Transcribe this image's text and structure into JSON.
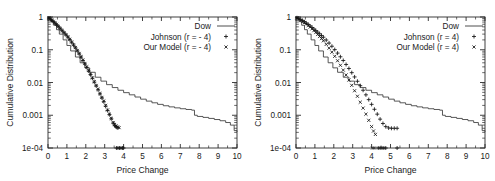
{
  "figure": {
    "panel_count": 2,
    "background": "#ffffff",
    "ink": "#1a1a1a"
  },
  "chart_data": [
    {
      "type": "line",
      "panel": "left",
      "title": "",
      "xlabel": "Price Change",
      "ylabel": "Cumulative Distribution",
      "xlim": [
        0,
        10
      ],
      "ylim": [
        0.0001,
        1
      ],
      "yscale": "log",
      "xscale": "linear",
      "grid": false,
      "xticks": [
        0,
        1,
        2,
        3,
        4,
        5,
        6,
        7,
        8,
        9,
        10
      ],
      "xticklabels": [
        "0",
        "1",
        "2",
        "3",
        "4",
        "5",
        "6",
        "7",
        "8",
        "9",
        "10"
      ],
      "yticks": [
        1,
        0.1,
        0.01,
        0.001,
        0.0001
      ],
      "yticklabels": [
        "1",
        "0.1",
        "0.01",
        "0.001",
        "1e-04"
      ],
      "legend_position": "top-right",
      "legend": [
        {
          "name": "Dow",
          "marker": "line"
        },
        {
          "name": "Johnson (r = - 4)",
          "marker": "+"
        },
        {
          "name": "Our Model (r = - 4)",
          "marker": "x"
        }
      ],
      "series": [
        {
          "name": "Dow",
          "marker": "line",
          "x": [
            0.0,
            0.08,
            0.18,
            0.3,
            0.45,
            0.6,
            0.8,
            1.0,
            1.2,
            1.45,
            1.7,
            1.95,
            2.2,
            2.5,
            2.8,
            3.1,
            3.4,
            3.7,
            4.0,
            4.3,
            4.6,
            4.9,
            5.2,
            5.5,
            5.8,
            6.1,
            6.4,
            6.7,
            7.0,
            7.3,
            7.6,
            7.75,
            7.9,
            8.2,
            8.5,
            8.8,
            9.1,
            9.4,
            9.65,
            9.85,
            10.0
          ],
          "y": [
            1.0,
            0.87,
            0.72,
            0.56,
            0.41,
            0.3,
            0.2,
            0.135,
            0.092,
            0.06,
            0.04,
            0.028,
            0.0205,
            0.0145,
            0.011,
            0.0086,
            0.007,
            0.0058,
            0.0049,
            0.0042,
            0.0036,
            0.0031,
            0.0027,
            0.0024,
            0.00215,
            0.00195,
            0.0018,
            0.00168,
            0.00158,
            0.0015,
            0.00143,
            0.001,
            0.00092,
            0.00086,
            0.0008,
            0.00074,
            0.00068,
            0.0006,
            0.0005,
            0.00034,
            0.00032
          ]
        },
        {
          "name": "Johnson (r = - 4)",
          "marker": "+",
          "x": [
            0.05,
            0.12,
            0.2,
            0.28,
            0.36,
            0.45,
            0.55,
            0.65,
            0.75,
            0.85,
            0.95,
            1.05,
            1.15,
            1.25,
            1.35,
            1.45,
            1.55,
            1.65,
            1.75,
            1.85,
            1.95,
            2.05,
            2.15,
            2.25,
            2.35,
            2.45,
            2.55,
            2.65,
            2.75,
            2.85,
            2.95,
            3.05,
            3.15,
            3.25,
            3.35,
            3.45,
            3.52,
            3.58,
            3.64,
            3.7,
            3.62,
            3.7,
            3.78,
            3.86,
            3.94,
            4.0
          ],
          "y": [
            0.93,
            0.87,
            0.8,
            0.73,
            0.66,
            0.59,
            0.51,
            0.44,
            0.38,
            0.33,
            0.285,
            0.245,
            0.205,
            0.17,
            0.14,
            0.115,
            0.093,
            0.075,
            0.06,
            0.047,
            0.037,
            0.029,
            0.0225,
            0.0175,
            0.0135,
            0.0103,
            0.0079,
            0.006,
            0.0045,
            0.0034,
            0.0026,
            0.0019,
            0.0014,
            0.00105,
            0.00078,
            0.00058,
            0.0005,
            0.00046,
            0.00043,
            0.00041,
            0.0001,
            0.0001,
            0.0001,
            0.0001,
            0.0001,
            0.0001
          ]
        },
        {
          "name": "Our Model (r = - 4)",
          "marker": "x",
          "x": [
            0.05,
            0.12,
            0.2,
            0.28,
            0.36,
            0.45,
            0.55,
            0.65,
            0.75,
            0.85,
            0.95,
            1.05,
            1.15,
            1.25,
            1.35,
            1.45,
            1.55,
            1.65,
            1.75,
            1.85,
            1.95,
            2.05,
            2.15,
            2.25,
            2.35,
            2.45,
            2.55,
            2.65,
            2.75,
            2.85,
            2.95,
            3.05,
            3.15,
            3.25,
            3.35,
            3.45,
            3.52,
            3.6,
            3.68,
            3.76
          ],
          "y": [
            0.935,
            0.875,
            0.805,
            0.735,
            0.665,
            0.595,
            0.515,
            0.445,
            0.385,
            0.335,
            0.29,
            0.248,
            0.208,
            0.172,
            0.142,
            0.117,
            0.095,
            0.077,
            0.061,
            0.048,
            0.038,
            0.03,
            0.0232,
            0.018,
            0.0139,
            0.0106,
            0.0081,
            0.0062,
            0.0046,
            0.0035,
            0.0027,
            0.002,
            0.00145,
            0.00108,
            0.0008,
            0.0006,
            0.00052,
            0.00047,
            0.00044,
            0.00042
          ]
        }
      ]
    },
    {
      "type": "line",
      "panel": "right",
      "title": "",
      "xlabel": "Price Change",
      "ylabel": "Cumulative Distribution",
      "xlim": [
        0,
        10
      ],
      "ylim": [
        0.0001,
        1
      ],
      "yscale": "log",
      "xscale": "linear",
      "grid": false,
      "xticks": [
        0,
        1,
        2,
        3,
        4,
        5,
        6,
        7,
        8,
        9,
        10
      ],
      "xticklabels": [
        "0",
        "1",
        "2",
        "3",
        "4",
        "5",
        "6",
        "7",
        "8",
        "9",
        "10"
      ],
      "yticks": [
        1,
        0.1,
        0.01,
        0.001,
        0.0001
      ],
      "yticklabels": [
        "1",
        "0.1",
        "0.01",
        "0.001",
        "1e-04"
      ],
      "legend_position": "top-right",
      "legend": [
        {
          "name": "Dow",
          "marker": "line"
        },
        {
          "name": "Johnson (r = 4)",
          "marker": "+"
        },
        {
          "name": "Our Model (r = 4)",
          "marker": "x"
        }
      ],
      "series": [
        {
          "name": "Dow",
          "marker": "line",
          "x": [
            0.0,
            0.08,
            0.18,
            0.3,
            0.45,
            0.6,
            0.8,
            1.0,
            1.2,
            1.45,
            1.7,
            1.95,
            2.2,
            2.5,
            2.8,
            3.1,
            3.4,
            3.7,
            4.0,
            4.3,
            4.6,
            4.9,
            5.2,
            5.5,
            5.8,
            6.1,
            6.4,
            6.7,
            7.0,
            7.3,
            7.6,
            7.75,
            7.9,
            8.2,
            8.5,
            8.8,
            9.1,
            9.4,
            9.65,
            9.85,
            10.0
          ],
          "y": [
            1.0,
            0.87,
            0.72,
            0.56,
            0.41,
            0.3,
            0.2,
            0.135,
            0.092,
            0.06,
            0.04,
            0.028,
            0.0205,
            0.0145,
            0.011,
            0.0086,
            0.007,
            0.0058,
            0.0049,
            0.0042,
            0.0036,
            0.0031,
            0.0027,
            0.0024,
            0.00215,
            0.00195,
            0.0018,
            0.00168,
            0.00158,
            0.0015,
            0.00143,
            0.001,
            0.00092,
            0.00086,
            0.0008,
            0.00074,
            0.00068,
            0.0006,
            0.0005,
            0.00034,
            0.00032
          ]
        },
        {
          "name": "Johnson (r = 4)",
          "marker": "+",
          "x": [
            0.05,
            0.15,
            0.25,
            0.35,
            0.45,
            0.55,
            0.65,
            0.75,
            0.85,
            0.95,
            1.05,
            1.15,
            1.25,
            1.35,
            1.45,
            1.6,
            1.75,
            1.9,
            2.05,
            2.2,
            2.35,
            2.5,
            2.65,
            2.8,
            2.95,
            3.1,
            3.25,
            3.4,
            3.55,
            3.7,
            3.85,
            4.0,
            4.15,
            4.3,
            4.45,
            4.6,
            4.75,
            4.9,
            5.05,
            5.2,
            5.35,
            4.35,
            4.45,
            4.55,
            4.65,
            4.75,
            5.35
          ],
          "y": [
            0.945,
            0.885,
            0.825,
            0.765,
            0.705,
            0.645,
            0.585,
            0.53,
            0.478,
            0.43,
            0.385,
            0.345,
            0.308,
            0.273,
            0.242,
            0.198,
            0.16,
            0.128,
            0.101,
            0.079,
            0.061,
            0.047,
            0.0355,
            0.0268,
            0.02,
            0.0148,
            0.0109,
            0.008,
            0.0058,
            0.0042,
            0.003,
            0.00215,
            0.00152,
            0.00108,
            0.00076,
            0.00056,
            0.00045,
            0.00041,
            0.0004,
            0.0004,
            0.0004,
            0.0001,
            0.0001,
            0.0001,
            0.0001,
            0.0001,
            0.0001
          ]
        },
        {
          "name": "Our Model (r = 4)",
          "marker": "x",
          "x": [
            0.05,
            0.15,
            0.25,
            0.35,
            0.45,
            0.55,
            0.65,
            0.75,
            0.85,
            0.95,
            1.05,
            1.15,
            1.25,
            1.35,
            1.45,
            1.6,
            1.75,
            1.9,
            2.05,
            2.2,
            2.35,
            2.5,
            2.65,
            2.8,
            2.95,
            3.1,
            3.25,
            3.4,
            3.55,
            3.7,
            3.85,
            4.0,
            4.1,
            4.2,
            4.05,
            4.15
          ],
          "y": [
            0.94,
            0.875,
            0.81,
            0.745,
            0.68,
            0.615,
            0.552,
            0.492,
            0.436,
            0.384,
            0.336,
            0.293,
            0.254,
            0.219,
            0.188,
            0.146,
            0.112,
            0.0845,
            0.063,
            0.0462,
            0.0335,
            0.024,
            0.017,
            0.0119,
            0.0082,
            0.0056,
            0.0038,
            0.0025,
            0.00165,
            0.00108,
            0.0007,
            0.00045,
            0.00033,
            0.00026,
            0.0001,
            0.0001
          ]
        }
      ]
    }
  ]
}
